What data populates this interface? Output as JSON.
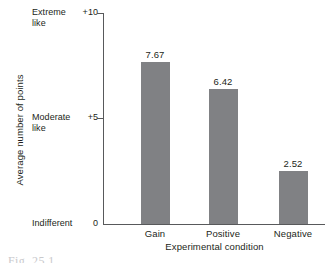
{
  "chart_data": {
    "type": "bar",
    "title": "",
    "categories": [
      "Gain",
      "Positive",
      "Negative"
    ],
    "values": [
      7.67,
      6.42,
      2.52
    ],
    "value_labels": [
      "7.67",
      "6.42",
      "2.52"
    ],
    "xlabel": "Experimental condition",
    "ylabel": "Average number of points",
    "ylim": [
      0,
      10
    ],
    "yticks": [
      0,
      5,
      10
    ],
    "ytick_labels": [
      "0",
      "+5",
      "+10"
    ],
    "ytick_anchors": [
      "Indifferent",
      "Moderate\nlike",
      "Extreme\nlike"
    ],
    "grid": false,
    "legend": null,
    "bar_color": "#808184",
    "axis_color": "#58595b"
  },
  "axis": {
    "y_title": "Average number of points",
    "x_title": "Experimental condition",
    "ticks": [
      {
        "anchor": "Extreme\nlike",
        "value": "+10"
      },
      {
        "anchor": "Moderate\nlike",
        "value": "+5"
      },
      {
        "anchor": "Indifferent",
        "value": "0"
      }
    ]
  },
  "bars": [
    {
      "category": "Gain",
      "value": 7.67,
      "label": "7.67"
    },
    {
      "category": "Positive",
      "value": 6.42,
      "label": "6.42"
    },
    {
      "category": "Negative",
      "value": 2.52,
      "label": "2.52"
    }
  ],
  "caption": {
    "partial_text": "Fig. 25.1"
  }
}
